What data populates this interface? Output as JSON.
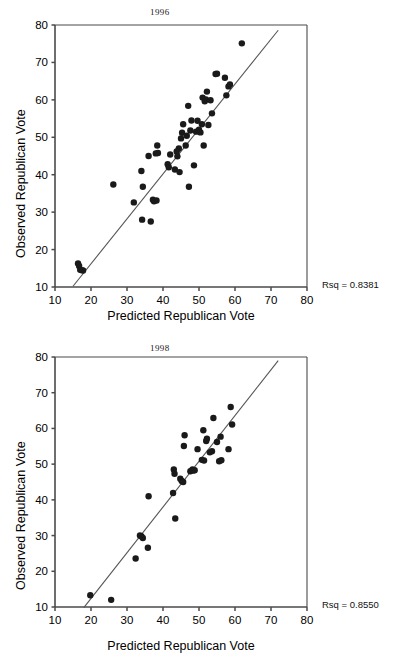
{
  "page": {
    "background": "#ffffff",
    "marker_color": "#1a1a1a",
    "axis_color": "#4a4a4a",
    "fit_line_color": "#555555"
  },
  "charts": [
    {
      "id": "chart-1996",
      "title": "1996",
      "xlabel": "Predicted Republican Vote",
      "ylabel": "Observed Republican Vote",
      "rsq_label": "Rsq = 0.8381",
      "chart_data": {
        "type": "scatter",
        "title": "1996",
        "xlabel": "Predicted Republican Vote",
        "ylabel": "Observed Republican Vote",
        "xlim": [
          10,
          80
        ],
        "ylim": [
          10,
          80
        ],
        "xticks": [
          10,
          20,
          30,
          40,
          50,
          60,
          70,
          80
        ],
        "yticks": [
          10,
          20,
          30,
          40,
          50,
          60,
          70,
          80
        ],
        "grid": false,
        "legend": "none",
        "annotations": [
          "Rsq = 0.8381"
        ],
        "r_squared": 0.8381,
        "fit_line": {
          "x": [
            15.0,
            72.0
          ],
          "y": [
            10.2,
            78.6
          ]
        },
        "points": [
          [
            16.4,
            16.3
          ],
          [
            16.7,
            15.6
          ],
          [
            17.0,
            14.6
          ],
          [
            17.4,
            14.5
          ],
          [
            17.8,
            14.4
          ],
          [
            26.2,
            37.4
          ],
          [
            31.9,
            32.6
          ],
          [
            34.0,
            41.0
          ],
          [
            34.2,
            28.0
          ],
          [
            34.4,
            36.8
          ],
          [
            36.0,
            45.0
          ],
          [
            36.6,
            27.5
          ],
          [
            37.2,
            33.3
          ],
          [
            37.5,
            32.9
          ],
          [
            38.0,
            45.7
          ],
          [
            38.2,
            33.1
          ],
          [
            38.4,
            47.8
          ],
          [
            38.6,
            45.8
          ],
          [
            41.3,
            42.8
          ],
          [
            41.6,
            42.0
          ],
          [
            42.0,
            45.4
          ],
          [
            43.3,
            41.4
          ],
          [
            43.8,
            46.2
          ],
          [
            44.0,
            44.9
          ],
          [
            44.4,
            47.0
          ],
          [
            44.6,
            40.7
          ],
          [
            45.0,
            49.7
          ],
          [
            45.3,
            51.2
          ],
          [
            45.6,
            53.5
          ],
          [
            46.3,
            47.8
          ],
          [
            46.6,
            50.4
          ],
          [
            47.0,
            58.4
          ],
          [
            47.2,
            36.8
          ],
          [
            47.6,
            51.8
          ],
          [
            47.9,
            54.5
          ],
          [
            48.6,
            42.5
          ],
          [
            49.2,
            51.5
          ],
          [
            49.6,
            54.4
          ],
          [
            50.0,
            52.0
          ],
          [
            50.4,
            51.3
          ],
          [
            50.8,
            53.5
          ],
          [
            51.0,
            60.6
          ],
          [
            51.3,
            47.8
          ],
          [
            51.6,
            59.6
          ],
          [
            51.9,
            60.1
          ],
          [
            52.2,
            62.2
          ],
          [
            52.6,
            53.3
          ],
          [
            53.2,
            59.9
          ],
          [
            53.6,
            56.4
          ],
          [
            54.6,
            66.9
          ],
          [
            55.0,
            67.0
          ],
          [
            57.2,
            65.9
          ],
          [
            57.6,
            61.2
          ],
          [
            58.2,
            63.6
          ],
          [
            58.6,
            64.1
          ],
          [
            61.9,
            75.1
          ]
        ]
      }
    },
    {
      "id": "chart-1998",
      "title": "1998",
      "xlabel": "Predicted Republican Vote",
      "ylabel": "Observed Republican Vote",
      "rsq_label": "Rsq = 0.8550",
      "chart_data": {
        "type": "scatter",
        "title": "1998",
        "xlabel": "Predicted Republican Vote",
        "ylabel": "Observed Republican Vote",
        "xlim": [
          10,
          80
        ],
        "ylim": [
          10,
          80
        ],
        "xticks": [
          10,
          20,
          30,
          40,
          50,
          60,
          70,
          80
        ],
        "yticks": [
          10,
          20,
          30,
          40,
          50,
          60,
          70,
          80
        ],
        "grid": false,
        "legend": "none",
        "annotations": [
          "Rsq = 0.8550"
        ],
        "r_squared": 0.855,
        "fit_line": {
          "x": [
            18.0,
            72.0
          ],
          "y": [
            9.8,
            79.0
          ]
        },
        "points": [
          [
            19.8,
            13.3
          ],
          [
            25.6,
            12.0
          ],
          [
            32.4,
            23.6
          ],
          [
            33.6,
            30.0
          ],
          [
            34.0,
            29.8
          ],
          [
            34.4,
            29.3
          ],
          [
            35.8,
            26.6
          ],
          [
            36.0,
            41.0
          ],
          [
            42.8,
            41.9
          ],
          [
            43.0,
            48.5
          ],
          [
            43.2,
            47.3
          ],
          [
            43.4,
            34.8
          ],
          [
            44.8,
            45.9
          ],
          [
            45.2,
            45.3
          ],
          [
            45.6,
            45.0
          ],
          [
            45.8,
            55.1
          ],
          [
            46.0,
            58.1
          ],
          [
            47.6,
            48.0
          ],
          [
            48.2,
            48.5
          ],
          [
            48.4,
            48.2
          ],
          [
            48.8,
            48.3
          ],
          [
            49.6,
            54.2
          ],
          [
            50.8,
            51.2
          ],
          [
            51.2,
            59.5
          ],
          [
            51.4,
            51.0
          ],
          [
            52.0,
            56.5
          ],
          [
            52.2,
            57.1
          ],
          [
            53.0,
            53.3
          ],
          [
            53.6,
            53.6
          ],
          [
            54.0,
            62.9
          ],
          [
            55.0,
            56.2
          ],
          [
            55.6,
            50.8
          ],
          [
            56.0,
            57.7
          ],
          [
            56.2,
            51.1
          ],
          [
            58.2,
            54.2
          ],
          [
            58.8,
            66.0
          ],
          [
            59.2,
            61.1
          ]
        ]
      }
    }
  ]
}
